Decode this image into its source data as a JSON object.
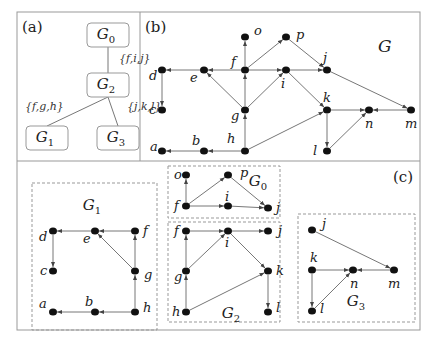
{
  "panels": {
    "a": {
      "label": "(a)",
      "symbol": "Ψ",
      "tree_nodes": [
        {
          "id": "G0",
          "base": "G",
          "sub": "0",
          "x": 108,
          "y": 35
        },
        {
          "id": "G2",
          "base": "G",
          "sub": "2",
          "x": 108,
          "y": 85
        },
        {
          "id": "G1",
          "base": "G",
          "sub": "1",
          "x": 47,
          "y": 138
        },
        {
          "id": "G3",
          "base": "G",
          "sub": "3",
          "x": 118,
          "y": 138
        }
      ],
      "tree_edges": [
        {
          "from": "G0",
          "to": "G2",
          "label": "{f,i,j}"
        },
        {
          "from": "G2",
          "to": "G1",
          "label": "{f,g,h}"
        },
        {
          "from": "G2",
          "to": "G3",
          "label": "{j,k,l}"
        }
      ]
    },
    "b": {
      "label": "(b)",
      "graph_label": "G",
      "nodes": [
        {
          "id": "a",
          "x": 162,
          "y": 151
        },
        {
          "id": "b",
          "x": 204,
          "y": 151
        },
        {
          "id": "c",
          "x": 162,
          "y": 110
        },
        {
          "id": "d",
          "x": 162,
          "y": 70
        },
        {
          "id": "e",
          "x": 204,
          "y": 70
        },
        {
          "id": "f",
          "x": 245,
          "y": 70
        },
        {
          "id": "g",
          "x": 245,
          "y": 110
        },
        {
          "id": "h",
          "x": 245,
          "y": 151
        },
        {
          "id": "i",
          "x": 286,
          "y": 70
        },
        {
          "id": "j",
          "x": 327,
          "y": 70
        },
        {
          "id": "k",
          "x": 327,
          "y": 110
        },
        {
          "id": "l",
          "x": 327,
          "y": 151
        },
        {
          "id": "m",
          "x": 411,
          "y": 110
        },
        {
          "id": "n",
          "x": 369,
          "y": 110
        },
        {
          "id": "o",
          "x": 245,
          "y": 37
        },
        {
          "id": "p",
          "x": 286,
          "y": 37
        }
      ],
      "edges": [
        [
          "f",
          "o"
        ],
        [
          "f",
          "p"
        ],
        [
          "f",
          "e"
        ],
        [
          "f",
          "i"
        ],
        [
          "e",
          "d"
        ],
        [
          "d",
          "c"
        ],
        [
          "g",
          "f"
        ],
        [
          "g",
          "e"
        ],
        [
          "g",
          "i"
        ],
        [
          "h",
          "g"
        ],
        [
          "h",
          "b"
        ],
        [
          "b",
          "a"
        ],
        [
          "h",
          "k"
        ],
        [
          "p",
          "j"
        ],
        [
          "i",
          "j"
        ],
        [
          "i",
          "k"
        ],
        [
          "j",
          "m"
        ],
        [
          "k",
          "n"
        ],
        [
          "m",
          "n"
        ],
        [
          "k",
          "l"
        ],
        [
          "l",
          "n"
        ]
      ]
    },
    "c": {
      "label": "(c)",
      "subgraphs": [
        {
          "id": "G1",
          "base": "G",
          "sub": "1",
          "nodes": [
            {
              "id": "d",
              "x": 53,
              "y": 231
            },
            {
              "id": "e",
              "x": 95,
              "y": 231
            },
            {
              "id": "f",
              "x": 135,
              "y": 231
            },
            {
              "id": "c",
              "x": 53,
              "y": 271
            },
            {
              "id": "g",
              "x": 135,
              "y": 271
            },
            {
              "id": "a",
              "x": 53,
              "y": 312
            },
            {
              "id": "b",
              "x": 95,
              "y": 312
            },
            {
              "id": "h",
              "x": 135,
              "y": 312
            }
          ],
          "edges": [
            [
              "f",
              "e"
            ],
            [
              "e",
              "d"
            ],
            [
              "d",
              "c"
            ],
            [
              "g",
              "f"
            ],
            [
              "g",
              "e"
            ],
            [
              "h",
              "g"
            ],
            [
              "h",
              "b"
            ],
            [
              "b",
              "a"
            ]
          ]
        },
        {
          "id": "G0",
          "base": "G",
          "sub": "0",
          "nodes": [
            {
              "id": "o",
              "x": 186,
              "y": 175
            },
            {
              "id": "p",
              "x": 228,
              "y": 175
            },
            {
              "id": "f",
              "x": 186,
              "y": 206
            },
            {
              "id": "i",
              "x": 228,
              "y": 206
            },
            {
              "id": "j",
              "x": 268,
              "y": 208
            }
          ],
          "edges": [
            [
              "f",
              "o"
            ],
            [
              "f",
              "p"
            ],
            [
              "f",
              "i"
            ],
            [
              "i",
              "j"
            ],
            [
              "p",
              "j"
            ]
          ]
        },
        {
          "id": "G2",
          "base": "G",
          "sub": "2",
          "nodes": [
            {
              "id": "f",
              "x": 186,
              "y": 231
            },
            {
              "id": "i",
              "x": 228,
              "y": 231
            },
            {
              "id": "j",
              "x": 268,
              "y": 231
            },
            {
              "id": "g",
              "x": 186,
              "y": 271
            },
            {
              "id": "k",
              "x": 268,
              "y": 271
            },
            {
              "id": "h",
              "x": 186,
              "y": 312
            },
            {
              "id": "l",
              "x": 268,
              "y": 312
            }
          ],
          "edges": [
            [
              "f",
              "i"
            ],
            [
              "i",
              "j"
            ],
            [
              "g",
              "f"
            ],
            [
              "g",
              "i"
            ],
            [
              "i",
              "k"
            ],
            [
              "h",
              "g"
            ],
            [
              "h",
              "k"
            ],
            [
              "k",
              "l"
            ]
          ]
        },
        {
          "id": "G3",
          "base": "G",
          "sub": "3",
          "nodes": [
            {
              "id": "j",
              "x": 312,
              "y": 230
            },
            {
              "id": "k",
              "x": 312,
              "y": 270
            },
            {
              "id": "n",
              "x": 353,
              "y": 270
            },
            {
              "id": "m",
              "x": 394,
              "y": 270
            },
            {
              "id": "l",
              "x": 312,
              "y": 311
            }
          ],
          "edges": [
            [
              "j",
              "m"
            ],
            [
              "k",
              "n"
            ],
            [
              "m",
              "n"
            ],
            [
              "k",
              "l"
            ],
            [
              "l",
              "n"
            ]
          ]
        }
      ]
    }
  }
}
